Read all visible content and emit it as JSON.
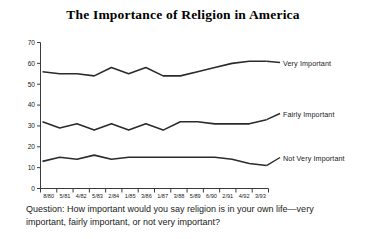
{
  "chart_data": {
    "type": "line",
    "title": "The Importance of Religion in America",
    "xlabel": "",
    "ylabel": "",
    "ylim": [
      0,
      70
    ],
    "yticks": [
      0,
      10,
      20,
      30,
      40,
      50,
      60,
      70
    ],
    "grid": false,
    "legend_position": "right-inline-labels",
    "categories": [
      "8/80",
      "5/81",
      "4/82",
      "5/83",
      "2/84",
      "1/85",
      "3/86",
      "1/87",
      "3/88",
      "5/89",
      "6/90",
      "2/91",
      "4/92",
      "3/93"
    ],
    "series": [
      {
        "name": "Very Important",
        "values": [
          56,
          55,
          55,
          54,
          58,
          55,
          58,
          54,
          54,
          56,
          58,
          60,
          61,
          61
        ]
      },
      {
        "name": "Fairly Important",
        "values": [
          32,
          29,
          31,
          28,
          31,
          28,
          31,
          28,
          32,
          32,
          31,
          31,
          31,
          33
        ]
      },
      {
        "name": "Not Very Important",
        "values": [
          13,
          15,
          14,
          16,
          14,
          15,
          15,
          15,
          15,
          15,
          15,
          14,
          12,
          11
        ]
      }
    ],
    "annotations": {
      "caption": "Question: How important would you say religion is in your own life—very important, fairly important, or not very important?"
    }
  },
  "labels": {
    "very_important": "Very Important",
    "fairly_important": "Fairly Important",
    "not_very_important": "Not Very Important"
  },
  "colors": {
    "line": "#2b2b2b",
    "axis": "#3a3a3a",
    "text": "#1a1a1a",
    "background": "#ffffff"
  }
}
